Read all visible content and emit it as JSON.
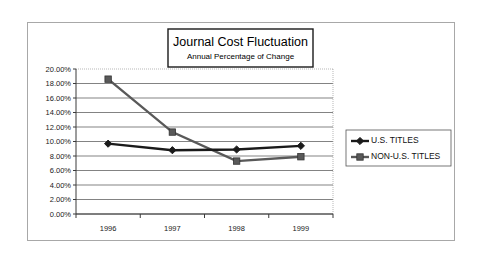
{
  "chart_data": {
    "type": "line",
    "title": "Journal Cost Fluctuation",
    "subtitle": "Annual Percentage of Change",
    "xlabel": "",
    "ylabel": "",
    "categories": [
      "1996",
      "1997",
      "1998",
      "1999"
    ],
    "ylim": [
      0,
      20
    ],
    "ytick_step": 2,
    "ytick_labels": [
      "20.00%",
      "18.00%",
      "16.00%",
      "14.00%",
      "12.00%",
      "10.00%",
      "8.00%",
      "6.00%",
      "4.00%",
      "2.00%",
      "0.00%"
    ],
    "grid": true,
    "legend_position": "right",
    "series": [
      {
        "name": "U.S. TITLES",
        "marker": "diamond",
        "color": "#1a1a1a",
        "values": [
          9.7,
          8.8,
          8.9,
          9.4
        ]
      },
      {
        "name": "NON-U.S. TITLES",
        "marker": "square",
        "color": "#595959",
        "values": [
          18.6,
          11.3,
          7.3,
          7.9
        ]
      }
    ]
  },
  "legend": {
    "items": [
      {
        "label": "U.S. TITLES"
      },
      {
        "label": "NON-U.S. TITLES"
      }
    ]
  }
}
